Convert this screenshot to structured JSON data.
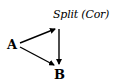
{
  "diagram": {
    "nodes": [
      {
        "id": "A",
        "label": "A"
      },
      {
        "id": "split",
        "label": "Split (Cor)"
      },
      {
        "id": "B",
        "label": "B"
      }
    ],
    "edges": [
      {
        "from": "A",
        "to": "split"
      },
      {
        "from": "A",
        "to": "B"
      },
      {
        "from": "split",
        "to": "B"
      }
    ],
    "colors": {
      "ink": "#000000",
      "background": "#ffffff"
    }
  }
}
